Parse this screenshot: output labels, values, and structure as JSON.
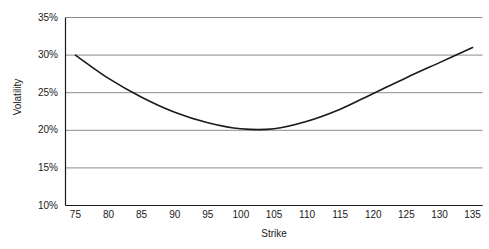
{
  "chart_data": {
    "type": "line",
    "title": "",
    "xlabel": "Strike",
    "ylabel": "Volatility",
    "xlim": [
      73.5,
      136.5
    ],
    "ylim": [
      10,
      35
    ],
    "grid": "horizontal",
    "legend": "none",
    "x_ticks": [
      "75",
      "80",
      "85",
      "90",
      "95",
      "100",
      "105",
      "110",
      "115",
      "120",
      "125",
      "130",
      "135"
    ],
    "x_tick_values": [
      75,
      80,
      85,
      90,
      95,
      100,
      105,
      110,
      115,
      120,
      125,
      130,
      135
    ],
    "y_ticks": [
      "10%",
      "15%",
      "20%",
      "25%",
      "30%",
      "35%"
    ],
    "y_tick_values": [
      10,
      15,
      20,
      25,
      30,
      35
    ],
    "series": [
      {
        "name": "Volatility smile",
        "color": "#1a1a1a",
        "x": [
          75,
          80,
          85,
          90,
          95,
          100,
          105,
          110,
          115,
          120,
          125,
          130,
          135
        ],
        "values": [
          30.0,
          26.9,
          24.4,
          22.4,
          21.0,
          20.2,
          20.2,
          21.2,
          22.8,
          24.9,
          27.0,
          29.0,
          31.0
        ]
      }
    ]
  },
  "axis": {
    "axis_color": "#1a1a1a",
    "grid_color": "#8c8c8c",
    "background": "#ffffff"
  }
}
